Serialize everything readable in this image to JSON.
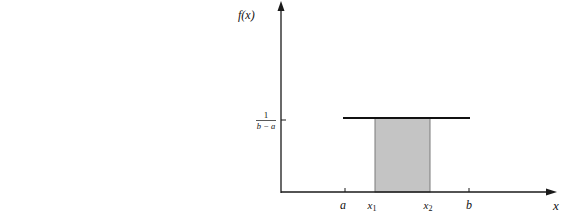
{
  "diagram": {
    "y_axis_label": "f(x)",
    "x_axis_label": "x",
    "density_label": {
      "numerator": "1",
      "denominator": "b − a"
    },
    "x_ticks": [
      {
        "id": "a",
        "label": "a",
        "x": 345
      },
      {
        "id": "x1",
        "label": "x",
        "sub": "1",
        "x": 375
      },
      {
        "id": "x2",
        "label": "x",
        "sub": "2",
        "x": 430
      },
      {
        "id": "b",
        "label": "b",
        "x": 469
      }
    ],
    "colors": {
      "axis": "#1a1a1a",
      "density_line": "#111111",
      "shaded_region": "#c4c4c4",
      "shaded_border": "#7a7a7a",
      "background": "#ffffff"
    }
  }
}
